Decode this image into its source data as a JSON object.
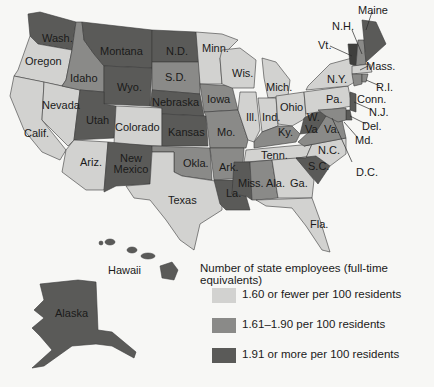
{
  "legend": {
    "title": "Number of state employees (full-time equivalents)",
    "items": [
      {
        "label": "1.60 or fewer per 100 residents",
        "color": "#d2d2d0"
      },
      {
        "label": "1.61–1.90 per 100 residents",
        "color": "#8a8a88"
      },
      {
        "label": "1.91 or more per 100 residents",
        "color": "#5a5a58"
      }
    ]
  },
  "states": {
    "wash": "Wash.",
    "oregon": "Oregon",
    "calif": "Calif.",
    "nevada": "Nevada",
    "idaho": "Idaho",
    "montana": "Montana",
    "wyo": "Wyo.",
    "utah": "Utah",
    "ariz": "Ariz.",
    "colorado": "Colorado",
    "newmexico": "New Mexico",
    "nd": "N.D.",
    "sd": "S.D.",
    "nebraska": "Nebraska",
    "kansas": "Kansas",
    "okla": "Okla.",
    "texas": "Texas",
    "minn": "Minn.",
    "iowa": "Iowa",
    "mo": "Mo.",
    "ark": "Ark.",
    "la": "La.",
    "wis": "Wis.",
    "ill": "Ill.",
    "mich": "Mich.",
    "ind": "Ind.",
    "ohio": "Ohio",
    "ky": "Ky.",
    "tenn": "Tenn.",
    "miss": "Miss.",
    "ala": "Ala.",
    "ga": "Ga.",
    "fla": "Fla.",
    "sc": "S.C.",
    "nc": "N.C.",
    "va": "Va.",
    "wva_w": "W.",
    "wva_va": "Va",
    "pa": "Pa.",
    "ny": "N.Y.",
    "vt": "Vt.",
    "nh": "N.H.",
    "maine": "Maine",
    "mass": "Mass.",
    "ri": "R.I.",
    "conn": "Conn.",
    "nj": "N.J.",
    "del": "Del.",
    "md": "Md.",
    "dc": "D.C.",
    "hawaii": "Hawaii",
    "alaska": "Alaska"
  },
  "categories": {
    "low": [
      "Oregon",
      "Calif.",
      "Nevada",
      "Ariz.",
      "Colorado",
      "Texas",
      "Minn.",
      "Wis.",
      "Mich.",
      "Ill.",
      "Ind.",
      "Ohio",
      "Pa.",
      "N.Y.",
      "Tenn.",
      "N.C.",
      "Ga.",
      "Fla.",
      "Mass."
    ],
    "medium": [
      "Idaho",
      "S.D.",
      "Iowa",
      "Mo.",
      "Okla.",
      "Ark.",
      "Ky.",
      "Ala.",
      "Va.",
      "N.H.",
      "R.I.",
      "Conn.",
      "Md."
    ],
    "high": [
      "Wash.",
      "Montana",
      "Wyo.",
      "N.D.",
      "Nebraska",
      "Kansas",
      "Utah",
      "New Mexico",
      "La.",
      "Miss.",
      "S.C.",
      "W.Va.",
      "Vt.",
      "Maine",
      "Del.",
      "N.J.",
      "Alaska",
      "Hawaii"
    ]
  }
}
